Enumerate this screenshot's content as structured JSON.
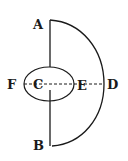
{
  "diagram": {
    "type": "geometric-figure",
    "background": "#ffffff",
    "stroke_color": "#1a1a1a",
    "labels": {
      "A": "A",
      "B": "B",
      "C": "C",
      "D": "D",
      "E": "E",
      "F": "F"
    },
    "elements": [
      {
        "kind": "semicircle-arc",
        "from": "A",
        "through": "D",
        "to": "B"
      },
      {
        "kind": "vertical-line",
        "from": "A",
        "to": "B",
        "passes": "C"
      },
      {
        "kind": "ellipse",
        "center": "C",
        "through": [
          "F",
          "E"
        ]
      },
      {
        "kind": "dashed-line",
        "from": "F",
        "to": "D",
        "passes": [
          "C",
          "E"
        ]
      }
    ]
  }
}
